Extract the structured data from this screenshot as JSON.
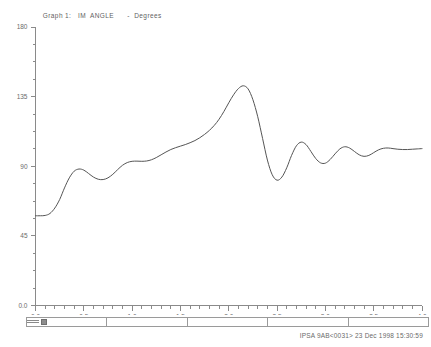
{
  "header": {
    "graph_label": "Graph 1:",
    "variable": "IM  ANGLE",
    "separator": "-",
    "units": "Degrees",
    "full_title": "Graph 1:   IM  ANGLE      -  Degrees"
  },
  "footer": {
    "text": "IPSA 9AB<0031> 23 Dec 1998 15:30:59",
    "case_id": "IPSA 9AB<0031>",
    "date": "23 Dec 1998",
    "time": "15:30:59"
  },
  "scrollbar": {
    "segment_count": 5,
    "thumb_position_pct": 3
  },
  "colors": {
    "background": "#ffffff",
    "axis": "#8a8a8a",
    "trace": "#555555",
    "text": "#6a6a6a"
  },
  "chart_data": {
    "type": "line",
    "title": "Graph 1:   IM  ANGLE      -  Degrees",
    "xlabel": "",
    "ylabel": "Degrees",
    "xlim": [
      0.0,
      4.0
    ],
    "ylim": [
      0,
      180
    ],
    "grid": false,
    "legend": false,
    "xticks": [
      0.0,
      0.5,
      1.0,
      1.5,
      2.0,
      2.5,
      3.0,
      3.5,
      4.0
    ],
    "xticklabels": [
      "0.0",
      "0.5",
      "1.0",
      "1.5",
      "2.0",
      "2.5",
      "3.0",
      "3.5",
      "4.0"
    ],
    "x_minor_tick_step": 0.1,
    "yticks": [
      0,
      45,
      90,
      135,
      180
    ],
    "yticklabels": [
      "0.0",
      "45",
      "90",
      "135",
      "180"
    ],
    "y_minor_tick_step": 11.25,
    "series": [
      {
        "name": "IM ANGLE",
        "color": "#555555",
        "x": [
          0.0,
          0.05,
          0.1,
          0.15,
          0.2,
          0.25,
          0.3,
          0.35,
          0.4,
          0.45,
          0.5,
          0.55,
          0.6,
          0.65,
          0.7,
          0.75,
          0.8,
          0.85,
          0.9,
          0.95,
          1.0,
          1.05,
          1.1,
          1.15,
          1.2,
          1.25,
          1.3,
          1.35,
          1.4,
          1.45,
          1.5,
          1.55,
          1.6,
          1.65,
          1.7,
          1.75,
          1.8,
          1.85,
          1.9,
          1.95,
          2.0,
          2.05,
          2.1,
          2.15,
          2.2,
          2.25,
          2.3,
          2.35,
          2.4,
          2.45,
          2.5,
          2.55,
          2.6,
          2.65,
          2.7,
          2.75,
          2.8,
          2.85,
          2.9,
          2.95,
          3.0,
          3.05,
          3.1,
          3.15,
          3.2,
          3.25,
          3.3,
          3.35,
          3.4,
          3.45,
          3.5,
          3.55,
          3.6,
          3.65,
          3.7,
          3.75,
          3.8,
          3.85,
          3.9,
          3.95,
          4.0
        ],
        "y": [
          58.0,
          58.0,
          58.2,
          59.5,
          63.0,
          68.5,
          76.0,
          82.5,
          86.8,
          88.2,
          87.5,
          85.3,
          83.0,
          81.6,
          81.4,
          82.5,
          84.8,
          87.8,
          90.6,
          92.4,
          93.2,
          93.3,
          93.2,
          93.4,
          94.2,
          95.6,
          97.4,
          99.2,
          100.8,
          102.0,
          103.0,
          104.0,
          105.2,
          106.6,
          108.4,
          110.6,
          113.2,
          116.4,
          120.4,
          125.4,
          131.0,
          136.2,
          140.2,
          142.0,
          140.0,
          133.0,
          122.0,
          108.0,
          94.0,
          84.5,
          81.0,
          83.0,
          89.0,
          97.0,
          103.2,
          105.6,
          104.0,
          99.6,
          95.0,
          92.2,
          92.0,
          94.4,
          98.0,
          101.2,
          102.6,
          101.8,
          99.6,
          97.4,
          96.4,
          97.0,
          98.8,
          100.6,
          101.6,
          101.8,
          101.4,
          101.0,
          100.8,
          100.8,
          101.0,
          101.2,
          101.4
        ]
      }
    ],
    "annotations": {
      "initial_value": 58.0,
      "first_local_max": {
        "x": 0.45,
        "y": 88.2
      },
      "first_local_min": {
        "x": 0.7,
        "y": 81.4
      },
      "global_peak": {
        "x": 2.15,
        "y": 142.0
      },
      "post_peak_trough": {
        "x": 2.5,
        "y": 81.0
      },
      "settling_value": 101.3
    }
  }
}
